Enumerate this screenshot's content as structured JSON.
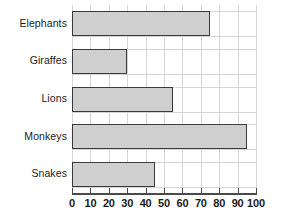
{
  "chart_data": {
    "type": "bar",
    "orientation": "horizontal",
    "title": "",
    "subtitle": "",
    "xlabel": "",
    "ylabel": "",
    "categories": [
      "Elephants",
      "Giraffes",
      "Lions",
      "Monkeys",
      "Snakes"
    ],
    "values": [
      75,
      30,
      55,
      95,
      45
    ],
    "series": [
      {
        "name": "",
        "values": [
          75,
          30,
          55,
          95,
          45
        ]
      }
    ],
    "xlim": [
      0,
      100
    ],
    "xticks": [
      0,
      10,
      20,
      30,
      40,
      50,
      60,
      70,
      80,
      90,
      100
    ],
    "xtick_labels": [
      "0",
      "10",
      "20",
      "30",
      "40",
      "50",
      "60",
      "70",
      "80",
      "90",
      "100"
    ],
    "grid": true,
    "grid_axis": "both",
    "legend": false,
    "legend_position": "none",
    "annotations": [],
    "colors": {
      "bar_fill": "#cfcfcf",
      "bar_border": "#3a3a3a",
      "grid": "#d5d5d5",
      "axis": "#4a4a4a",
      "text": "#1b1b1b",
      "background": "#ffffff"
    }
  }
}
